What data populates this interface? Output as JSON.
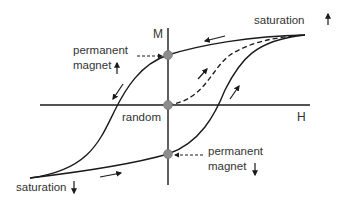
{
  "diagram": {
    "axes": {
      "vertical": "M",
      "horizontal": "H"
    },
    "labels": {
      "saturation_up": "saturation",
      "saturation_down": "saturation",
      "perm_up_line1": "permanent",
      "perm_up_line2": "magnet",
      "perm_down_line1": "permanent",
      "perm_down_line2": "magnet",
      "random": "random"
    },
    "points": [
      {
        "name": "permanent magnet up",
        "x": 168,
        "y": 55
      },
      {
        "name": "random",
        "x": 168,
        "y": 105
      },
      {
        "name": "permanent magnet down",
        "x": 168,
        "y": 154
      }
    ],
    "colors": {
      "line": "#1a1a1a",
      "dot": "#8c8c8c",
      "text": "#333333"
    }
  }
}
